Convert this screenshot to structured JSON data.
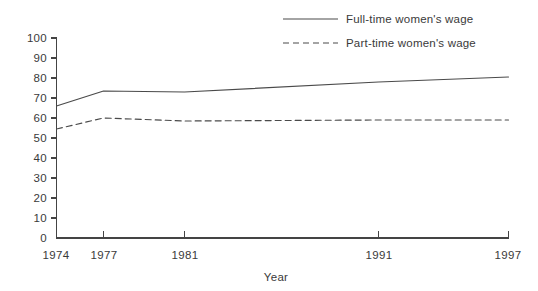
{
  "chart_data": {
    "type": "line",
    "title": "",
    "subtitle": "",
    "xlabel": "Year",
    "ylabel": "",
    "x": [
      1974,
      1977,
      1981,
      1991,
      1997
    ],
    "categories": [
      "1974",
      "1977",
      "1981",
      "1991",
      "1997"
    ],
    "xlim": [
      1974,
      1997
    ],
    "ylim": [
      0,
      100
    ],
    "y_ticks": [
      0,
      10,
      20,
      30,
      40,
      50,
      60,
      70,
      80,
      90,
      100
    ],
    "y_tick_labels": [
      "0",
      "10",
      "20",
      "30",
      "40",
      "50",
      "60",
      "70",
      "80",
      "90",
      "100"
    ],
    "x_tick_labels": [
      "1974",
      "1977",
      "1981",
      "1991",
      "1997"
    ],
    "grid": false,
    "legend_position": "top-right",
    "series": [
      {
        "name": "Full-time women's wage",
        "style": "solid",
        "color": "#4a4a4a",
        "values": [
          66,
          73.5,
          73,
          78,
          80.5
        ]
      },
      {
        "name": "Part-time women's wage",
        "style": "dashed",
        "color": "#4a4a4a",
        "values": [
          54.5,
          60,
          58.5,
          59,
          59
        ]
      }
    ]
  },
  "legend": {
    "items": [
      {
        "label": "Full-time women's wage"
      },
      {
        "label": "Part-time women's wage"
      }
    ]
  },
  "axes": {
    "x_title": "Year",
    "y_title": ""
  },
  "colors": {
    "ink": "#3a3a3a",
    "axis": "#444444",
    "series": "#4a4a4a",
    "background": "#ffffff"
  }
}
